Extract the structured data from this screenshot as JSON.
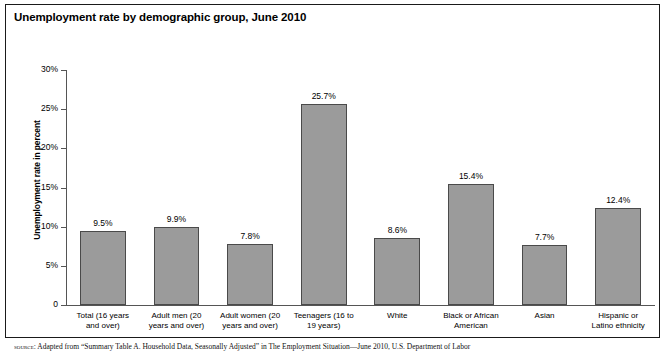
{
  "figure": {
    "title": "Unemployment rate by demographic group, June 2010",
    "source_label": "source:",
    "source_text": "Adapted from “Summary Table A. Household Data, Seasonally Adjusted” in The Employment Situation—June 2010, U.S. Department of Labor"
  },
  "chart_data": {
    "type": "bar",
    "title": "Unemployment rate by demographic group, June 2010",
    "xlabel": "",
    "ylabel": "Unemployment rate in percent",
    "ylim": [
      0,
      30
    ],
    "ytick_labels": [
      "0",
      "5%",
      "10%",
      "15%",
      "20%",
      "25%",
      "30%"
    ],
    "ytick_values": [
      0,
      5,
      10,
      15,
      20,
      25,
      30
    ],
    "grid": false,
    "legend": "none",
    "bar_color": "#9b9b9b",
    "bar_edge_color": "#4a4a4a",
    "categories": [
      "Total (16 years and over)",
      "Adult men (20 years and over)",
      "Adult women (20 years and over)",
      "Teenagers (16 to 19 years)",
      "White",
      "Black or African American",
      "Asian",
      "Hispanic or Latino ethnicity"
    ],
    "category_lines": [
      [
        "Total (16 years",
        "and over)"
      ],
      [
        "Adult men (20",
        "years and over)"
      ],
      [
        "Adult women (20",
        "years and over)"
      ],
      [
        "Teenagers (16 to",
        "19 years)"
      ],
      [
        "White"
      ],
      [
        "Black or African",
        "American"
      ],
      [
        "Asian"
      ],
      [
        "Hispanic or",
        "Latino ethnicity"
      ]
    ],
    "values": [
      9.5,
      9.9,
      7.8,
      25.7,
      8.6,
      15.4,
      7.7,
      12.4
    ],
    "value_labels": [
      "9.5%",
      "9.9%",
      "7.8%",
      "25.7%",
      "8.6%",
      "15.4%",
      "7.7%",
      "12.4%"
    ]
  }
}
